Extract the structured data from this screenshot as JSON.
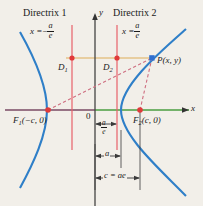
{
  "figure": {
    "background_color": "#f2efe9",
    "width": 203,
    "height": 206
  },
  "axes": {
    "x_label": "x",
    "y_label": "y",
    "origin_label": "0",
    "x_axis_y": 110,
    "y_axis_x": 95,
    "x_axis_color_left": "#7a4a63",
    "x_axis_color_right": "#4a9e3f",
    "y_axis_color": "#444444"
  },
  "directrices": [
    {
      "name": "Directrix 1",
      "title": "Directrix 1",
      "equation_lhs": "x =",
      "equation_sign": "−",
      "numerator": "a",
      "denominator": "e",
      "x_px": 72,
      "color": "#e8606a"
    },
    {
      "name": "Directrix 2",
      "title": "Directrix 2",
      "equation_lhs": "x =",
      "equation_sign": "",
      "numerator": "a",
      "denominator": "e",
      "x_px": 117,
      "color": "#e8606a"
    }
  ],
  "points": [
    {
      "id": "D1",
      "label": "D",
      "subscript": "1",
      "x": 72,
      "y": 58,
      "marker": "dot",
      "color": "#e03a3a"
    },
    {
      "id": "D2",
      "label": "D",
      "subscript": "2",
      "x": 117,
      "y": 58,
      "marker": "dot",
      "color": "#e03a3a"
    },
    {
      "id": "P",
      "label": "P(x, y)",
      "subscript": "",
      "x": 152,
      "y": 58,
      "marker": "square",
      "color": "#2f6fd0"
    },
    {
      "id": "F1",
      "label": "F",
      "subscript": "1",
      "suffix": "(−c, 0)",
      "x": 48,
      "y": 110,
      "marker": "dot",
      "color": "#e03a3a"
    },
    {
      "id": "F2",
      "label": "F",
      "subscript": "2",
      "suffix": "(c, 0)",
      "x": 140,
      "y": 110,
      "marker": "dot",
      "color": "#e03a3a"
    }
  ],
  "curve": {
    "type": "hyperbola",
    "color": "#2f7fc8",
    "left_vertex_x": 47,
    "right_vertex_x": 121,
    "center_y": 110
  },
  "connectors": {
    "horizontal_line_color": "#e8c98a",
    "focal_ray_color": "#d06a7a",
    "focal_ray_style": "dashed"
  },
  "measurements": [
    {
      "id": "a-over-e",
      "numerator": "a",
      "denominator": "e",
      "from_x": 95,
      "to_x": 117,
      "y": 124,
      "kind": "fraction"
    },
    {
      "id": "a",
      "text": "a",
      "from_x": 95,
      "to_x": 121,
      "y": 156,
      "kind": "text"
    },
    {
      "id": "c-eq-ae",
      "text": "c = ae",
      "from_x": 95,
      "to_x": 140,
      "y": 178,
      "kind": "text"
    }
  ]
}
